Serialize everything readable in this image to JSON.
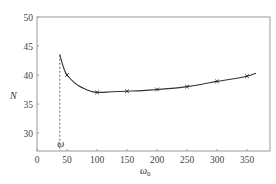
{
  "chart_data": {
    "type": "line",
    "title": "",
    "xlabel": "ω0",
    "ylabel": "N",
    "xlim": [
      0,
      388
    ],
    "ylim": [
      27,
      50
    ],
    "grid": false,
    "legend": null,
    "x_ticks": [
      0,
      50,
      100,
      150,
      200,
      250,
      300,
      350
    ],
    "y_ticks": [
      30,
      35,
      40,
      45,
      50
    ],
    "series": [
      {
        "name": "N",
        "marker": "x",
        "markers_x": [
          50,
          100,
          150,
          200,
          250,
          300,
          350
        ],
        "markers_y": [
          40.0,
          37.0,
          37.2,
          37.5,
          38.0,
          38.9,
          39.8
        ],
        "curve_x": [
          38,
          42,
          46,
          50,
          60,
          70,
          80,
          90,
          100,
          125,
          150,
          175,
          200,
          225,
          250,
          275,
          300,
          325,
          350,
          365
        ],
        "curve_y": [
          43.5,
          42.0,
          40.8,
          40.0,
          38.9,
          38.1,
          37.6,
          37.2,
          37.0,
          37.1,
          37.2,
          37.3,
          37.5,
          37.7,
          38.0,
          38.4,
          38.9,
          39.3,
          39.8,
          40.3
        ]
      }
    ],
    "annotations": [
      {
        "type": "vertical-dashed-line",
        "x": 38,
        "from_y": 27,
        "to_y": 43.5,
        "label": "ω"
      }
    ]
  },
  "labels": {
    "x_axis": "ω",
    "x_axis_sub": "0",
    "y_axis": "N",
    "omega_marker": "ω"
  }
}
